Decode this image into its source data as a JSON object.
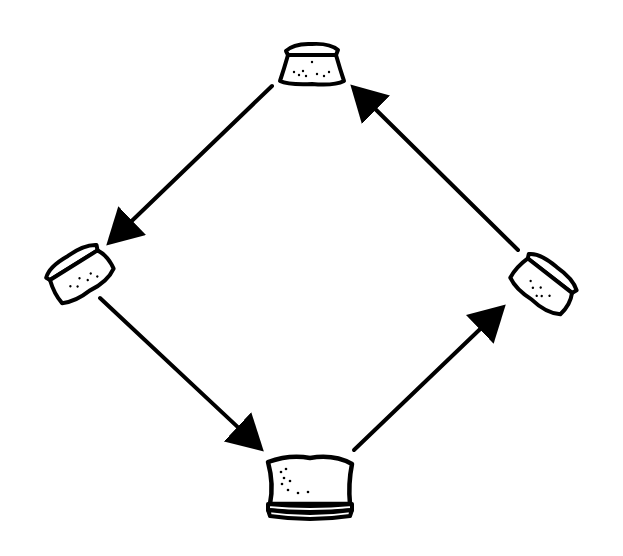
{
  "diagram": {
    "type": "cycle",
    "colors": {
      "ink": "#000000",
      "background": "#ffffff"
    },
    "nodes": [
      {
        "id": "top",
        "icon": "bread-slice-icon",
        "x": 312,
        "y": 65
      },
      {
        "id": "left",
        "icon": "bread-slice-tilted-icon",
        "x": 78,
        "y": 272
      },
      {
        "id": "bottom",
        "icon": "bread-loaf-stacked-icon",
        "x": 310,
        "y": 488
      },
      {
        "id": "right",
        "icon": "bread-slice-tilted-icon",
        "x": 545,
        "y": 282
      }
    ],
    "edges": [
      {
        "from": "top",
        "to": "left"
      },
      {
        "from": "left",
        "to": "bottom"
      },
      {
        "from": "bottom",
        "to": "right"
      },
      {
        "from": "right",
        "to": "top"
      }
    ]
  }
}
